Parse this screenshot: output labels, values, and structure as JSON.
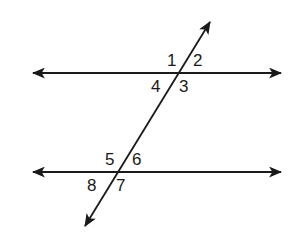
{
  "diagram": {
    "type": "parallel lines cut by a transversal",
    "colors": {
      "line": "#1a1a1a",
      "background": "#ffffff"
    },
    "lines": {
      "top": {
        "x1": 33,
        "y1": 73,
        "x2": 281,
        "y2": 73,
        "arrows": "both"
      },
      "bottom": {
        "x1": 33,
        "y1": 172,
        "x2": 281,
        "y2": 172,
        "arrows": "both"
      },
      "transversal": {
        "x1": 210,
        "y1": 22,
        "x2": 85,
        "y2": 226,
        "arrows": "both"
      }
    },
    "angles": [
      {
        "label": "1",
        "x": 167,
        "y": 66
      },
      {
        "label": "2",
        "x": 194,
        "y": 66
      },
      {
        "label": "4",
        "x": 151,
        "y": 92
      },
      {
        "label": "3",
        "x": 180,
        "y": 92
      },
      {
        "label": "5",
        "x": 105,
        "y": 165
      },
      {
        "label": "6",
        "x": 133,
        "y": 165
      },
      {
        "label": "8",
        "x": 87,
        "y": 191
      },
      {
        "label": "7",
        "x": 116,
        "y": 191
      }
    ]
  }
}
